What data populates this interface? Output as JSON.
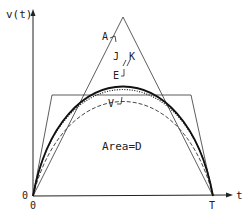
{
  "diagram": {
    "y_axis_label": "v(t)",
    "x_axis_label": "t",
    "origin_label": "0",
    "origin_tick_label": "0",
    "end_tick_label": "T",
    "area_label": "Area=D",
    "curves": [
      {
        "label": "A",
        "description": "triangular profile",
        "style": "thin solid"
      },
      {
        "label": "J",
        "description": "parabolic profile",
        "style": "thick solid"
      },
      {
        "label": "K",
        "description": "near-parabolic profile",
        "style": "dotted"
      },
      {
        "label": "E",
        "description": "smooth profile",
        "style": "dashed"
      },
      {
        "label": "V",
        "description": "trapezoidal profile",
        "style": "thin solid"
      }
    ],
    "colors": {
      "line": "#222222",
      "background": "#ffffff"
    }
  }
}
